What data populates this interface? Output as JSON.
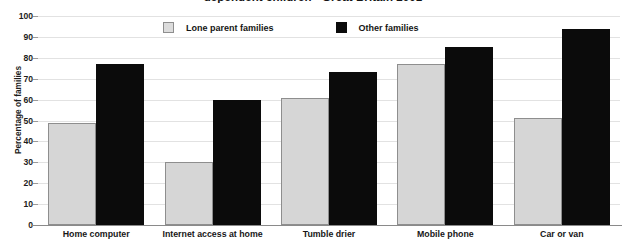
{
  "chart_data": {
    "type": "bar",
    "title": "dependent children - Great Britain 2001",
    "xlabel": "",
    "ylabel": "Percentage of families",
    "ylim": [
      0,
      100
    ],
    "ytick_step": 10,
    "yticks": [
      "100",
      "90",
      "80",
      "70",
      "60",
      "50",
      "40",
      "30",
      "20",
      "10",
      "0"
    ],
    "grid": true,
    "legend_position": "top-center",
    "categories": [
      "Home computer",
      "Internet access at home",
      "Tumble drier",
      "Mobile phone",
      "Car or van"
    ],
    "series": [
      {
        "name": "Lone parent families",
        "color": "#d6d6d6",
        "values": [
          49,
          30,
          61,
          77,
          51
        ]
      },
      {
        "name": "Other families",
        "color": "#0b0b0b",
        "values": [
          77,
          60,
          73,
          85,
          94
        ]
      }
    ]
  }
}
